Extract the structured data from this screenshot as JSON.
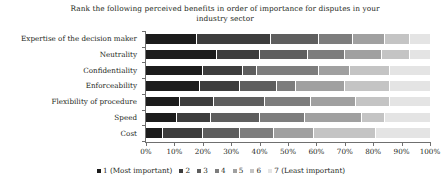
{
  "chart_data": {
    "type": "bar",
    "orientation": "horizontal",
    "stacked": true,
    "stack_mode": "percent",
    "title": "Rank the following perceived benefits in order of importance for disputes in your industry sector",
    "xlabel": "",
    "ylabel": "",
    "xlim": [
      0,
      100
    ],
    "xtick_labels": [
      "0%",
      "10%",
      "20%",
      "30%",
      "40%",
      "50%",
      "60%",
      "70%",
      "80%",
      "90%",
      "100%"
    ],
    "xtick_values": [
      0,
      10,
      20,
      30,
      40,
      50,
      60,
      70,
      80,
      90,
      100
    ],
    "grid": false,
    "legend_position": "bottom",
    "categories": [
      "Expertise of the decision maker",
      "Neutrality",
      "Confidentiality",
      "Enforceability",
      "Flexibility of procedure",
      "Speed",
      "Cost"
    ],
    "series": [
      {
        "name": "1 (Most important)",
        "color": "#1c1c1c",
        "values": [
          18,
          25,
          20,
          19,
          12,
          11,
          6
        ]
      },
      {
        "name": "2",
        "color": "#3d3d3d",
        "values": [
          26,
          15,
          14,
          14,
          12,
          12,
          14
        ]
      },
      {
        "name": "3",
        "color": "#5e5e5e",
        "values": [
          17,
          17,
          5,
          13,
          18,
          17,
          13
        ]
      },
      {
        "name": "4",
        "color": "#7d7d7d",
        "values": [
          12,
          13,
          22,
          7,
          16,
          16,
          12
        ]
      },
      {
        "name": "5",
        "color": "#a0a0a0",
        "values": [
          11,
          13,
          11,
          17,
          16,
          20,
          14
        ]
      },
      {
        "name": "6",
        "color": "#c4c4c4",
        "values": [
          9,
          10,
          14,
          16,
          12,
          8,
          22
        ]
      },
      {
        "name": "7 (Least important)",
        "color": "#e4e4e4",
        "values": [
          7,
          7,
          14,
          14,
          14,
          16,
          19
        ]
      }
    ]
  },
  "axis": {
    "line_color": "#6f6f6f"
  }
}
